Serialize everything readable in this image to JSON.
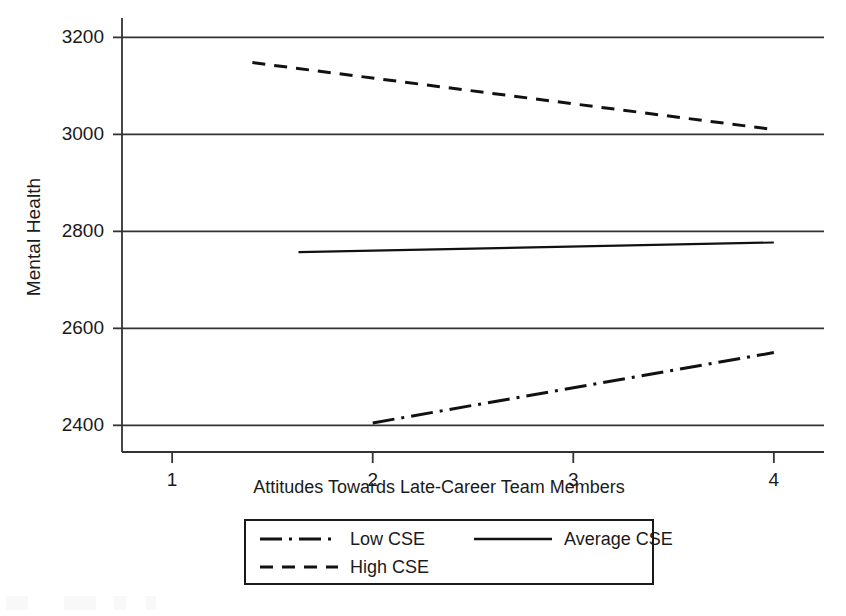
{
  "chart_data": {
    "type": "line",
    "title": "",
    "xlabel": "Attitudes Towards Late-Career Team Members",
    "ylabel": "Mental Health",
    "xlim": [
      0.75,
      4.25
    ],
    "ylim": [
      2345,
      3240
    ],
    "xticks": [
      1,
      2,
      3,
      4
    ],
    "xtick_labels": [
      "1",
      "2",
      "3",
      "4"
    ],
    "yticks": [
      2400,
      2600,
      2800,
      3000,
      3200
    ],
    "ytick_labels": [
      "2400",
      "2600",
      "2800",
      "3000",
      "3200"
    ],
    "grid": true,
    "grid_axis": "y",
    "legend_position": "below-axes",
    "series": [
      {
        "name": "Low CSE",
        "style": "dash-dot",
        "x": [
          2.0,
          4.0
        ],
        "y": [
          2405,
          2550
        ]
      },
      {
        "name": "Average CSE",
        "style": "solid",
        "x": [
          1.63,
          4.0
        ],
        "y": [
          2757,
          2777
        ]
      },
      {
        "name": "High CSE",
        "style": "dashed",
        "x": [
          1.4,
          4.0
        ],
        "y": [
          3148,
          3010
        ]
      }
    ]
  },
  "axes": {
    "y_title": "Mental Health",
    "x_title": "Attitudes Towards Late-Career Team Members"
  },
  "legend": {
    "entries": [
      {
        "label": "Low CSE",
        "style": "dash-dot"
      },
      {
        "label": "Average CSE",
        "style": "solid"
      },
      {
        "label": "High CSE",
        "style": "dashed"
      }
    ]
  }
}
